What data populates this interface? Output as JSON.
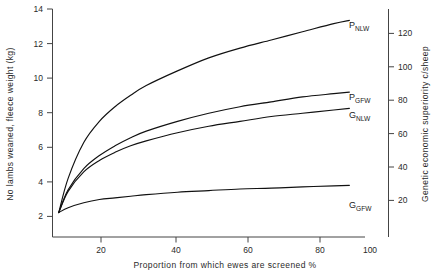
{
  "chart_data": {
    "type": "line",
    "title": "",
    "xlabel": "Proportion from which ewes are screened %",
    "ylabel_left": "No lambs weaned, fleece weight (kg)",
    "ylabel_right": "Genetic economic superiority c/sheep",
    "xlim": [
      0,
      100
    ],
    "ylim_left": [
      0,
      14
    ],
    "ylim_right": [
      0,
      130
    ],
    "grid": false,
    "legend_position": "inline-right-of-curve-ends",
    "xticks": [
      20,
      40,
      60,
      80,
      100
    ],
    "yticks_left": [
      2,
      4,
      6,
      8,
      10,
      12,
      14
    ],
    "yticks_right": [
      20,
      40,
      60,
      80,
      100,
      120
    ],
    "x": [
      2,
      5,
      10,
      15,
      20,
      25,
      30,
      40,
      50,
      60,
      70,
      80,
      90,
      95
    ],
    "series": [
      {
        "name": "P_NLW",
        "label_main": "P",
        "label_sub": "NLW",
        "values": [
          1.5,
          3.6,
          5.8,
          7.1,
          8.0,
          8.7,
          9.3,
          10.2,
          11.0,
          11.6,
          12.1,
          12.6,
          13.1,
          13.3
        ]
      },
      {
        "name": "P_GFW",
        "label_main": "P",
        "label_sub": "GFW",
        "values": [
          1.5,
          2.9,
          4.2,
          5.0,
          5.6,
          6.1,
          6.5,
          7.1,
          7.6,
          8.0,
          8.3,
          8.6,
          8.8,
          8.9
        ]
      },
      {
        "name": "G_NLW",
        "label_main": "G",
        "label_sub": "NLW",
        "values": [
          1.5,
          2.8,
          4.0,
          4.7,
          5.2,
          5.6,
          5.9,
          6.4,
          6.8,
          7.1,
          7.4,
          7.6,
          7.8,
          7.9
        ]
      },
      {
        "name": "G_GFW",
        "label_main": "G",
        "label_sub": "GFW",
        "values": [
          1.5,
          1.8,
          2.1,
          2.3,
          2.4,
          2.5,
          2.6,
          2.75,
          2.85,
          2.95,
          3.0,
          3.08,
          3.14,
          3.17
        ]
      }
    ],
    "colors": {
      "curve": "#111111",
      "axis": "#444444",
      "text": "#1a1a1a",
      "background": "#ffffff"
    }
  }
}
